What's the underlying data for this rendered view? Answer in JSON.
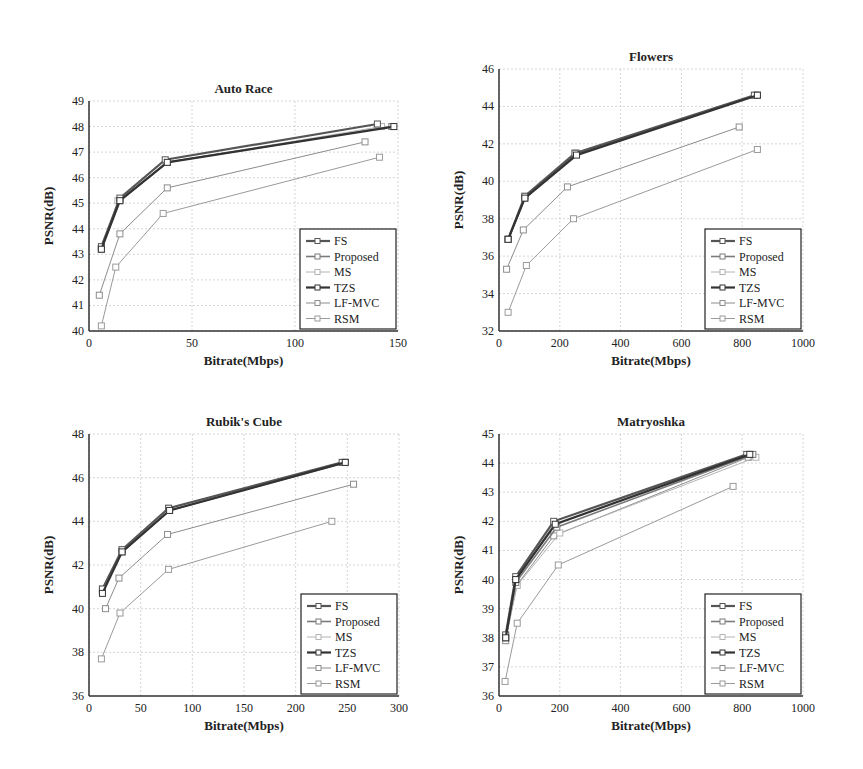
{
  "figure": {
    "background_text_faded": true
  },
  "chart_data": [
    {
      "type": "line",
      "title": "Auto Race",
      "xlabel": "Bitrate(Mbps)",
      "ylabel": "PSNR(dB)",
      "xlim": [
        0,
        150
      ],
      "ylim": [
        40,
        49
      ],
      "xticks": [
        0,
        50,
        100,
        150
      ],
      "yticks": [
        40,
        41,
        42,
        43,
        44,
        45,
        46,
        47,
        48,
        49
      ],
      "grid": true,
      "legend_position": "lower right",
      "series": [
        {
          "name": "FS",
          "x": [
            6,
            15,
            37,
            140
          ],
          "y": [
            43.3,
            45.2,
            46.7,
            48.1
          ]
        },
        {
          "name": "Proposed",
          "x": [
            6,
            15,
            38,
            147
          ],
          "y": [
            43.2,
            45.1,
            46.6,
            48.0
          ]
        },
        {
          "name": "MS",
          "x": [
            6,
            14,
            38,
            142
          ],
          "y": [
            43.2,
            45.1,
            46.6,
            48.0
          ]
        },
        {
          "name": "TZS",
          "x": [
            6,
            15,
            38,
            148
          ],
          "y": [
            43.2,
            45.1,
            46.6,
            48.0
          ]
        },
        {
          "name": "LF-MVC",
          "x": [
            5,
            15,
            38,
            134
          ],
          "y": [
            41.4,
            43.8,
            45.6,
            47.4
          ]
        },
        {
          "name": "RSM",
          "x": [
            6,
            13,
            36,
            141
          ],
          "y": [
            40.2,
            42.5,
            44.6,
            46.8
          ]
        }
      ]
    },
    {
      "type": "line",
      "title": "Flowers",
      "xlabel": "Bitrate(Mbps)",
      "ylabel": "PSNR(dB)",
      "xlim": [
        0,
        1000
      ],
      "ylim": [
        32,
        46
      ],
      "xticks": [
        0,
        200,
        400,
        600,
        800,
        1000
      ],
      "yticks": [
        32,
        34,
        36,
        38,
        40,
        42,
        44,
        46
      ],
      "grid": true,
      "legend_position": "lower right",
      "series": [
        {
          "name": "FS",
          "x": [
            30,
            85,
            250,
            840
          ],
          "y": [
            36.9,
            39.2,
            41.5,
            44.6
          ]
        },
        {
          "name": "Proposed",
          "x": [
            30,
            85,
            255,
            850
          ],
          "y": [
            36.9,
            39.1,
            41.5,
            44.6
          ]
        },
        {
          "name": "MS",
          "x": [
            30,
            85,
            250,
            845
          ],
          "y": [
            36.9,
            39.2,
            41.5,
            44.6
          ]
        },
        {
          "name": "TZS",
          "x": [
            30,
            85,
            255,
            850
          ],
          "y": [
            36.9,
            39.1,
            41.4,
            44.6
          ]
        },
        {
          "name": "LF-MVC",
          "x": [
            25,
            80,
            225,
            790
          ],
          "y": [
            35.3,
            37.4,
            39.7,
            42.9
          ]
        },
        {
          "name": "RSM",
          "x": [
            30,
            90,
            245,
            850
          ],
          "y": [
            33.0,
            35.5,
            38.0,
            41.7
          ]
        }
      ]
    },
    {
      "type": "line",
      "title": "Rubik's Cube",
      "xlabel": "Bitrate(Mbps)",
      "ylabel": "PSNR(dB)",
      "xlim": [
        0,
        300
      ],
      "ylim": [
        36,
        48
      ],
      "xticks": [
        0,
        50,
        100,
        150,
        200,
        250,
        300
      ],
      "yticks": [
        36,
        38,
        40,
        42,
        44,
        46,
        48
      ],
      "grid": true,
      "legend_position": "lower right",
      "series": [
        {
          "name": "FS",
          "x": [
            13,
            32,
            77,
            245
          ],
          "y": [
            40.9,
            42.7,
            44.6,
            46.7
          ]
        },
        {
          "name": "Proposed",
          "x": [
            13,
            32,
            78,
            248
          ],
          "y": [
            40.8,
            42.6,
            44.5,
            46.7
          ]
        },
        {
          "name": "MS",
          "x": [
            13,
            32,
            77,
            246
          ],
          "y": [
            40.9,
            42.7,
            44.6,
            46.7
          ]
        },
        {
          "name": "TZS",
          "x": [
            13,
            32,
            78,
            248
          ],
          "y": [
            40.7,
            42.6,
            44.5,
            46.7
          ]
        },
        {
          "name": "LF-MVC",
          "x": [
            16,
            29,
            76,
            256
          ],
          "y": [
            40.0,
            41.4,
            43.4,
            45.7
          ]
        },
        {
          "name": "RSM",
          "x": [
            12,
            30,
            77,
            235
          ],
          "y": [
            37.7,
            39.8,
            41.8,
            44.0
          ]
        }
      ]
    },
    {
      "type": "line",
      "title": "Matryoshka",
      "xlabel": "Bitrate(Mbps)",
      "ylabel": "PSNR(dB)",
      "xlim": [
        0,
        1000
      ],
      "ylim": [
        36,
        45
      ],
      "xticks": [
        0,
        200,
        400,
        600,
        800,
        1000
      ],
      "yticks": [
        36,
        37,
        38,
        39,
        40,
        41,
        42,
        43,
        44,
        45
      ],
      "grid": true,
      "legend_position": "lower right",
      "series": [
        {
          "name": "FS",
          "x": [
            22,
            55,
            180,
            815
          ],
          "y": [
            38.1,
            40.1,
            42.0,
            44.3
          ]
        },
        {
          "name": "Proposed",
          "x": [
            22,
            55,
            190,
            835
          ],
          "y": [
            38.0,
            39.9,
            41.8,
            44.3
          ]
        },
        {
          "name": "MS",
          "x": [
            22,
            60,
            200,
            845
          ],
          "y": [
            38.0,
            39.8,
            41.6,
            44.2
          ]
        },
        {
          "name": "TZS",
          "x": [
            22,
            55,
            185,
            825
          ],
          "y": [
            38.0,
            40.0,
            41.9,
            44.3
          ]
        },
        {
          "name": "LF-MVC",
          "x": [
            22,
            58,
            180,
            820
          ],
          "y": [
            37.9,
            39.8,
            41.5,
            44.2
          ]
        },
        {
          "name": "RSM",
          "x": [
            20,
            60,
            195,
            770
          ],
          "y": [
            36.5,
            38.5,
            40.5,
            43.2
          ]
        }
      ]
    }
  ],
  "legend": {
    "entries": [
      "FS",
      "Proposed",
      "MS",
      "TZS",
      "LF-MVC",
      "RSM"
    ]
  },
  "style": {
    "series_colors": {
      "FS": "#555555",
      "Proposed": "#7a7a7a",
      "MS": "#b4b4b4",
      "TZS": "#333333",
      "LF-MVC": "#8c8c8c",
      "RSM": "#9a9a9a"
    },
    "series_widths": {
      "FS": 2.2,
      "Proposed": 1.6,
      "MS": 1.0,
      "TZS": 2.2,
      "LF-MVC": 1.0,
      "RSM": 1.0
    },
    "axis_color": "#333333",
    "grid_color": "#cccccc"
  }
}
